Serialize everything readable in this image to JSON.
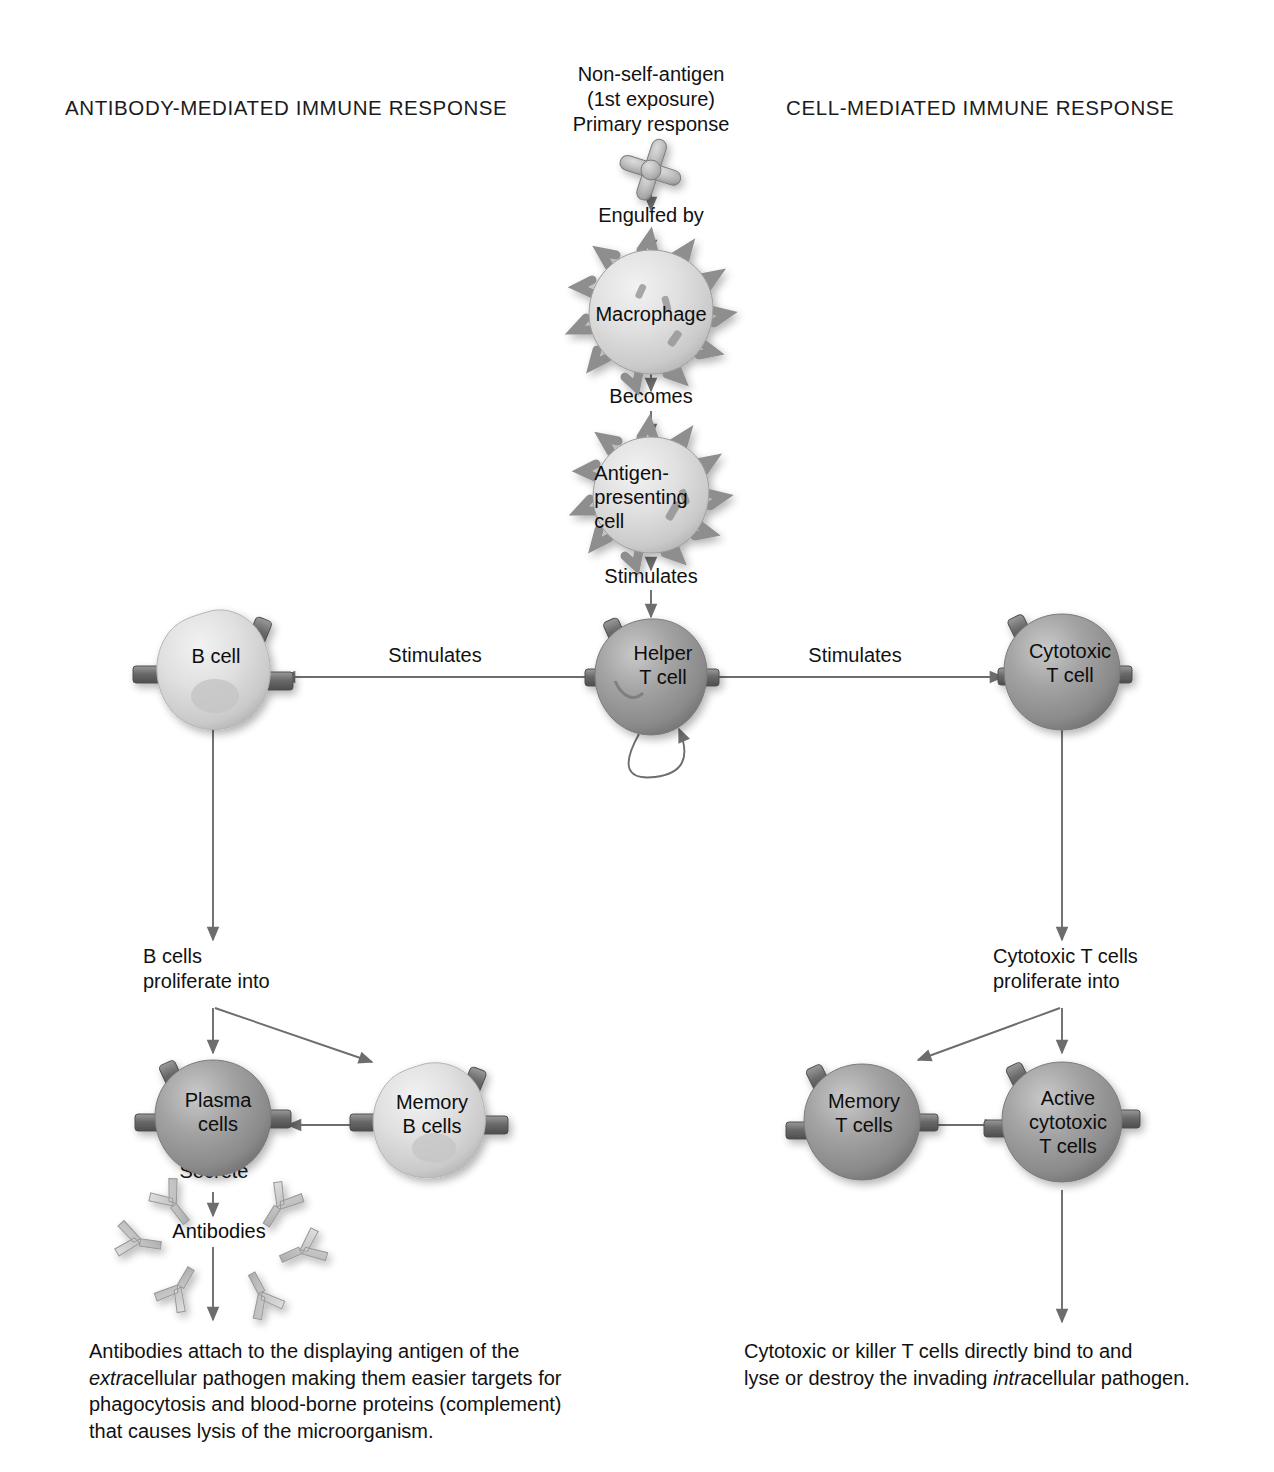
{
  "diagram": {
    "title_left": "ANTIBODY-MEDIATED IMMUNE RESPONSE",
    "title_right": "CELL-MEDIATED IMMUNE RESPONSE",
    "top_label": "Non-self-antigen\n(1st exposure)\nPrimary response",
    "colors": {
      "ink": "#111111",
      "arrow": "#6d6d6d",
      "cell_dark": "#8e8e8e",
      "cell_light": "#d8d8d8",
      "antibody": "#b9b9b9",
      "page": "#ffffff"
    },
    "steps": {
      "engulfed_by": "Engulfed by",
      "becomes": "Becomes",
      "stimulates_down": "Stimulates",
      "stimulates_left": "Stimulates",
      "stimulates_right": "Stimulates",
      "b_proliferate": "B cells\nproliferate into",
      "t_proliferate": "Cytotoxic T cells\nproliferate into",
      "secrete": "Secrete"
    },
    "cells": {
      "macrophage": "Macrophage",
      "apc": "Antigen-\npresenting\ncell",
      "helper_t": "Helper\nT cell",
      "b_cell": "B cell",
      "cytotoxic_t": "Cytotoxic\nT cell",
      "plasma": "Plasma\ncells",
      "memory_b": "Memory\nB cells",
      "memory_t": "Memory\nT cells",
      "active_cytotoxic_t": "Active\ncytotoxic\nT cells",
      "antibodies": "Antibodies"
    },
    "captions": {
      "left": {
        "line1": "Antibodies attach to the displaying antigen of the",
        "line2_italic": "extra",
        "line2_rest": "cellular pathogen making them easier targets for",
        "line3": "phagocytosis and blood-borne proteins (complement)",
        "line4": "that causes lysis of the microorganism."
      },
      "right": {
        "line1": "Cytotoxic or killer T cells directly bind to and",
        "line2_pre": "lyse or destroy the invading ",
        "line2_italic": "intra",
        "line2_rest": "cellular pathogen."
      }
    }
  }
}
